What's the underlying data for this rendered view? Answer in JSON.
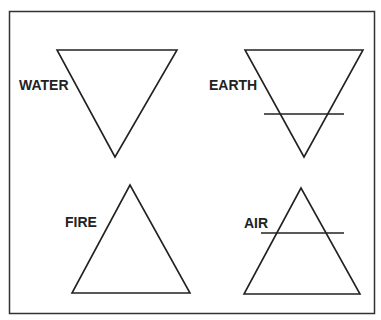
{
  "diagram": {
    "title": "",
    "elements": [
      {
        "name": "WATER",
        "symbol": "downward triangle",
        "crossbar": false
      },
      {
        "name": "EARTH",
        "symbol": "downward triangle",
        "crossbar": true
      },
      {
        "name": "FIRE",
        "symbol": "upward triangle",
        "crossbar": false
      },
      {
        "name": "AIR",
        "symbol": "upward triangle",
        "crossbar": true
      }
    ],
    "colors": {
      "stroke": "#222222",
      "background": "#ffffff"
    }
  }
}
